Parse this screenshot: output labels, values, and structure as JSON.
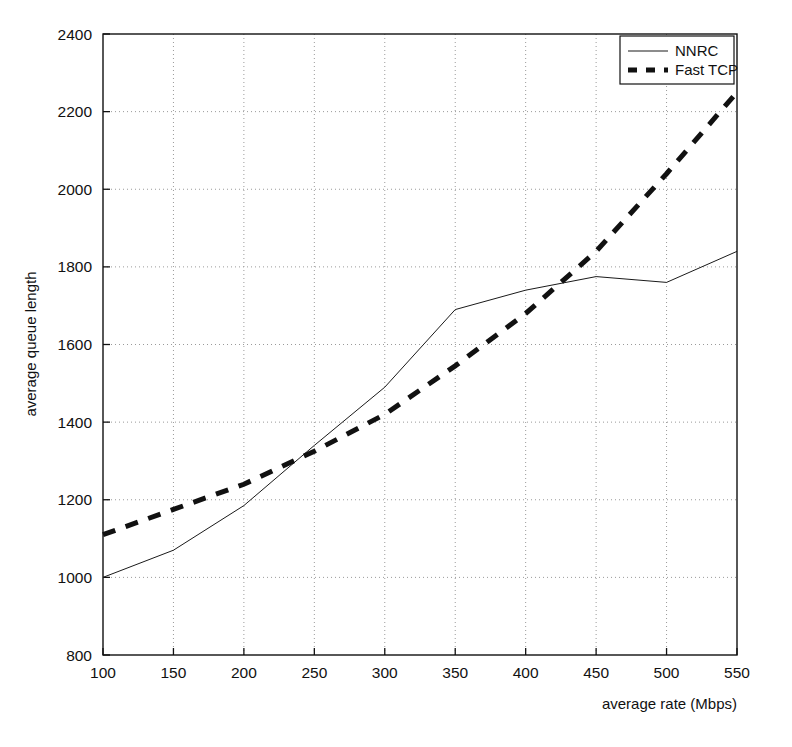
{
  "chart_data": {
    "type": "line",
    "title": "",
    "xlabel": "average rate (Mbps)",
    "ylabel": "average queue length",
    "xlim": [
      100,
      550
    ],
    "ylim": [
      800,
      2400
    ],
    "xticks": [
      100,
      150,
      200,
      250,
      300,
      350,
      400,
      450,
      500,
      550
    ],
    "xtick_labels": [
      "100",
      "150",
      "200",
      "250",
      "300",
      "350",
      "400",
      "450",
      "500",
      "550"
    ],
    "yticks": [
      800,
      1000,
      1200,
      1400,
      1600,
      1800,
      2000,
      2200,
      2400
    ],
    "ytick_labels": [
      "800",
      "1000",
      "1200",
      "1400",
      "1600",
      "1800",
      "2000",
      "2200",
      "2400"
    ],
    "grid": true,
    "grid_style": "dotted",
    "legend_position": "top-right",
    "x": [
      100,
      150,
      200,
      250,
      300,
      350,
      400,
      450,
      500,
      550
    ],
    "series": [
      {
        "name": "NNRC",
        "style": "solid",
        "width": 1,
        "color": "#1a1a1a",
        "values": [
          1000,
          1070,
          1185,
          1340,
          1490,
          1690,
          1740,
          1775,
          1760,
          1840
        ]
      },
      {
        "name": "Fast TCP",
        "style": "dashed",
        "width": 5,
        "color": "#111111",
        "values": [
          1110,
          1175,
          1240,
          1325,
          1420,
          1545,
          1680,
          1840,
          2040,
          2250
        ]
      }
    ]
  },
  "legend": {
    "entries": [
      {
        "label": "NNRC",
        "style": "solid"
      },
      {
        "label": "Fast TCP",
        "style": "dashed"
      }
    ]
  },
  "colors": {
    "axis": "#111111",
    "grid": "#9a9a9a",
    "background": "#ffffff",
    "series_nnrc": "#1a1a1a",
    "series_fasttcp": "#111111"
  }
}
